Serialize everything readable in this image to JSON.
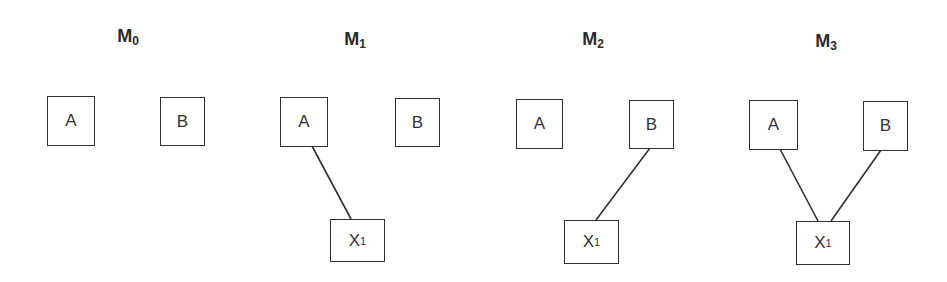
{
  "models": [
    {
      "title": "M",
      "subscript": "0",
      "nodes": {
        "A": "A",
        "B": "B"
      },
      "edges": []
    },
    {
      "title": "M",
      "subscript": "1",
      "nodes": {
        "A": "A",
        "B": "B",
        "X": "X",
        "X_sub": "1"
      },
      "edges": [
        [
          "A",
          "X1"
        ]
      ]
    },
    {
      "title": "M",
      "subscript": "2",
      "nodes": {
        "A": "A",
        "B": "B",
        "X": "X",
        "X_sub": "1"
      },
      "edges": [
        [
          "B",
          "X1"
        ]
      ]
    },
    {
      "title": "M",
      "subscript": "3",
      "nodes": {
        "A": "A",
        "B": "B",
        "X": "X",
        "X_sub": "1"
      },
      "edges": [
        [
          "A",
          "X1"
        ],
        [
          "B",
          "X1"
        ]
      ]
    }
  ],
  "colors": {
    "stroke": "#2f2f2f",
    "text": "#333333",
    "background": "#ffffff"
  }
}
